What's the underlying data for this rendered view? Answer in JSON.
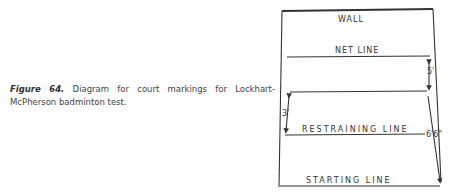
{
  "caption": {
    "figure_label": "Figure 64.",
    "text": "Diagram for court markings for Lockhart-McPherson badminton test."
  },
  "diagram": {
    "lines": {
      "wall": "WALL",
      "net": "NET LINE",
      "restraining": "RESTRAINING LINE",
      "starting": "STARTING LINE"
    },
    "dimensions": {
      "net_to_mark": "5'",
      "mark_to_restraining": "3'",
      "mark_to_starting": "6'6\""
    },
    "colors": {
      "ink": "#333333"
    }
  }
}
